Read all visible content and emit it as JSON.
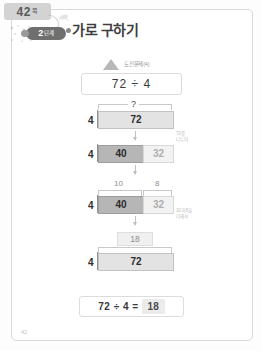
{
  "page": {
    "tab_number": "42",
    "tab_suffix": "쪽",
    "footer_number": "42"
  },
  "header": {
    "stage_number": "2",
    "stage_suffix": "단계",
    "title": "가로 구하기"
  },
  "problem": {
    "challenge_label": "도전문제(4)",
    "expression": "72 ÷ 4"
  },
  "model": {
    "rows": [
      {
        "left": "4",
        "bracket_label": "?",
        "cells": [
          {
            "value": "72",
            "style": "plain"
          }
        ]
      },
      {
        "left": "4",
        "cells": [
          {
            "value": "40",
            "style": "dark"
          },
          {
            "value": "32",
            "style": "light"
          }
        ]
      },
      {
        "left": "4",
        "top_labels": [
          "10",
          "8"
        ],
        "cells": [
          {
            "value": "40",
            "style": "dark"
          },
          {
            "value": "32",
            "style": "light"
          }
        ]
      },
      {
        "left": "4",
        "top_box": "18",
        "cells": [
          {
            "value": "72",
            "style": "plain"
          }
        ]
      }
    ],
    "notes": [
      "72를\n나누어",
      "10과 8을\n더해서"
    ]
  },
  "answer": {
    "equation": "72 ÷ 4 =",
    "result": "18"
  }
}
